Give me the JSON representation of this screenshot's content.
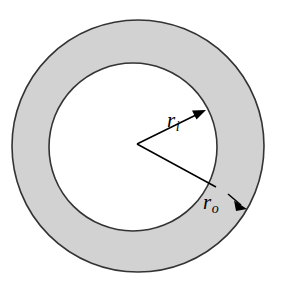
{
  "figure": {
    "kind": "annulus-cross-section-diagram",
    "background_color": "#ffffff",
    "ring_fill_color": "#d2d2d2",
    "hole_fill_color": "#ffffff",
    "stroke_color": "#333333"
  },
  "geometry": {
    "outer_circle": {
      "cx": 138,
      "cy": 146,
      "r": 126
    },
    "inner_circle": {
      "cx": 133,
      "cy": 147,
      "r": 84
    },
    "vertex": {
      "x": 137,
      "y": 144
    },
    "inner_arrow_tip": {
      "x": 206,
      "y": 110
    },
    "outer_arrow_tip": {
      "x": 247,
      "y": 209
    }
  },
  "labels": {
    "inner_radius": {
      "symbol": "r",
      "subscript": "i",
      "text": "r"
    },
    "outer_radius": {
      "symbol": "r",
      "subscript": "o",
      "text": "r"
    }
  },
  "annotations": {
    "inner_radius_subscript": "i",
    "outer_radius_subscript": "o"
  }
}
